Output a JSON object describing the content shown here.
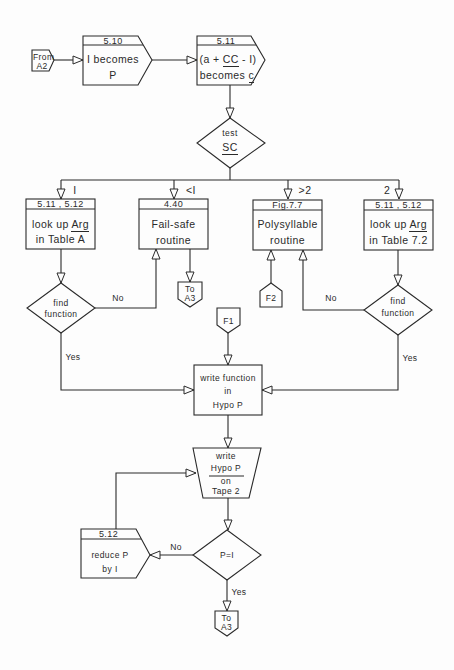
{
  "diagram": {
    "type": "flowchart",
    "entry": {
      "label_line1": "From",
      "label_line2": "A2"
    },
    "box_510": {
      "ref": "5.10",
      "line1": "I becomes",
      "line2": "P"
    },
    "box_511": {
      "ref": "5.11",
      "line1_pre": "(a + ",
      "line1_u": "CC",
      "line1_post": " - I)",
      "line2_pre": "becomes ",
      "line2_u": "c"
    },
    "test_sc": {
      "line1": "test",
      "line2": "SC"
    },
    "branches": [
      {
        "condition": "I",
        "ref": "5.11 , 5.12",
        "line1_pre": "look up ",
        "line1_u": "Arg",
        "line2": "in Table A"
      },
      {
        "condition": "<I",
        "ref": "4.40",
        "line1": "Fail-safe",
        "line2": "routine"
      },
      {
        "condition": ">2",
        "ref": "Fig.7.7",
        "line1": "Polysyllable",
        "line2": "routine"
      },
      {
        "condition": "2",
        "ref": "5.11 , 5.12",
        "line1_pre": "look up ",
        "line1_u": "Arg",
        "line2": "in Table 7.2"
      }
    ],
    "to_a3_upper": {
      "line1": "To",
      "line2": "A3"
    },
    "connector_f2": {
      "label": "F2"
    },
    "connector_f1": {
      "label": "F1"
    },
    "find_left": {
      "line1": "find",
      "line2": "function",
      "no": "No",
      "yes": "Yes"
    },
    "find_right": {
      "line1": "find",
      "line2": "function",
      "no": "No",
      "yes": "Yes"
    },
    "write_function": {
      "line1": "write function",
      "line2": "in",
      "line3": "Hypo P"
    },
    "write_tape": {
      "line1": "write",
      "line2": "Hypo P",
      "line3": "on",
      "line4": "Tape 2"
    },
    "test_p": {
      "label": "P=I",
      "no": "No",
      "yes": "Yes"
    },
    "reduce_box": {
      "ref": "5.12",
      "line1": "reduce P",
      "line2": "by I"
    },
    "to_a3_lower": {
      "line1": "To",
      "line2": "A3"
    },
    "colors": {
      "ink": "#2a2a2a",
      "paper": "#fdfdfd"
    }
  }
}
